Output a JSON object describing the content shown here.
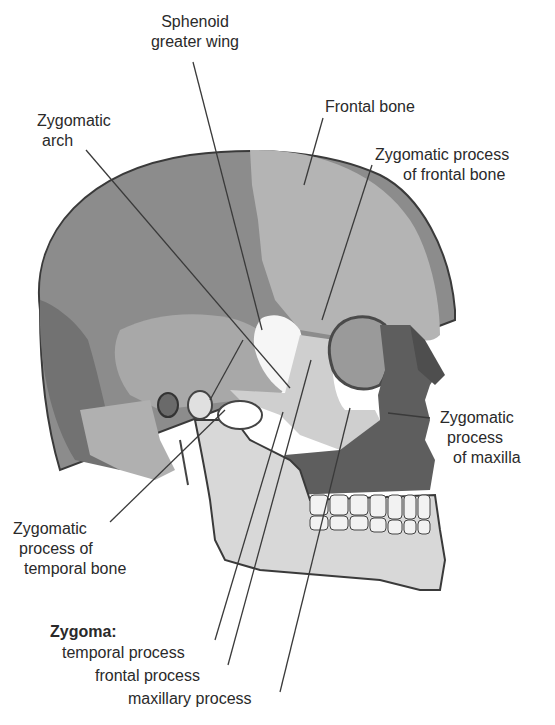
{
  "diagram": {
    "colors": {
      "background": "#ffffff",
      "parietal": "#8c8c8c",
      "frontal": "#b4b4b4",
      "temporal": "#a8a8a8",
      "occipital": "#727272",
      "sphenoid_greater_wing": "#f6f6f6",
      "zygoma": "#cfcfcf",
      "maxilla": "#5e5e5e",
      "mandible": "#d8d8d8",
      "teeth": "#f2f2f2",
      "outline": "#3a3a3a",
      "leader_line": "#3a3a3a",
      "text": "#2a2a2a"
    }
  },
  "labels": {
    "sphenoid_line1": "Sphenoid",
    "sphenoid_line2": "greater wing",
    "zyg_arch_line1": "Zygomatic",
    "zyg_arch_line2": "arch",
    "frontal_bone": "Frontal bone",
    "zpf_line1": "Zygomatic process",
    "zpf_line2": "of frontal bone",
    "zpm_line1": "Zygomatic",
    "zpm_line2": "process",
    "zpm_line3": "of maxilla",
    "zpt_line1": "Zygomatic",
    "zpt_line2": "process of",
    "zpt_line3": "temporal bone",
    "zygoma_heading": "Zygoma:",
    "zygoma_temporal": "temporal process",
    "zygoma_frontal": "frontal process",
    "zygoma_maxillary": "maxillary process"
  }
}
